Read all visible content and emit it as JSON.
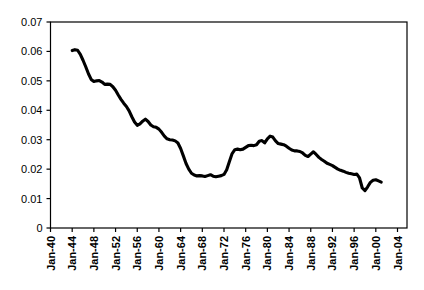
{
  "chart_data": {
    "type": "line",
    "title": "",
    "subtitle": "",
    "xlabel": "",
    "ylabel": "",
    "grid": false,
    "legend": null,
    "legend_position": "none",
    "xlim": [
      "Jan-40",
      "Jan-05"
    ],
    "ylim": [
      0,
      0.07
    ],
    "y_ticks": [
      0,
      0.01,
      0.02,
      0.03,
      0.04,
      0.05,
      0.06,
      0.07
    ],
    "y_tick_labels": [
      "0",
      "0.01",
      "0.02",
      "0.03",
      "0.04",
      "0.05",
      "0.06",
      "0.07"
    ],
    "x_ticks": [
      "Jan-40",
      "Jan-44",
      "Jan-48",
      "Jan-52",
      "Jan-56",
      "Jan-60",
      "Jan-64",
      "Jan-68",
      "Jan-72",
      "Jan-76",
      "Jan-80",
      "Jan-84",
      "Jan-88",
      "Jan-92",
      "Jan-96",
      "Jan-00",
      "Jan-04"
    ],
    "x_tick_labels": [
      "Jan-40",
      "Jan-44",
      "Jan-48",
      "Jan-52",
      "Jan-56",
      "Jan-60",
      "Jan-64",
      "Jan-68",
      "Jan-72",
      "Jan-76",
      "Jan-80",
      "Jan-84",
      "Jan-88",
      "Jan-92",
      "Jan-96",
      "Jan-00",
      "Jan-04"
    ],
    "series": [
      {
        "name": "series-1",
        "color": "#000000",
        "x": [
          1944.0,
          1944.5,
          1945.0,
          1945.5,
          1946.0,
          1946.5,
          1947.0,
          1947.5,
          1948.0,
          1948.5,
          1949.0,
          1949.5,
          1950.0,
          1950.5,
          1951.0,
          1951.5,
          1952.0,
          1952.5,
          1953.0,
          1953.5,
          1954.0,
          1954.5,
          1955.0,
          1955.5,
          1956.0,
          1956.5,
          1957.0,
          1957.5,
          1958.0,
          1958.5,
          1959.0,
          1959.5,
          1960.0,
          1960.5,
          1961.0,
          1961.5,
          1962.0,
          1962.5,
          1963.0,
          1963.5,
          1964.0,
          1964.5,
          1965.0,
          1965.5,
          1966.0,
          1966.5,
          1967.0,
          1967.5,
          1968.0,
          1968.5,
          1969.0,
          1969.5,
          1970.0,
          1970.5,
          1971.0,
          1971.5,
          1972.0,
          1972.5,
          1973.0,
          1973.5,
          1974.0,
          1974.5,
          1975.0,
          1975.5,
          1976.0,
          1976.5,
          1977.0,
          1977.5,
          1978.0,
          1978.5,
          1979.0,
          1979.5,
          1980.0,
          1980.5,
          1981.0,
          1981.5,
          1982.0,
          1982.5,
          1983.0,
          1983.5,
          1984.0,
          1984.5,
          1985.0,
          1985.5,
          1986.0,
          1986.5,
          1987.0,
          1987.5,
          1988.0,
          1988.5,
          1989.0,
          1989.5,
          1990.0,
          1990.5,
          1991.0,
          1991.5,
          1992.0,
          1992.5,
          1993.0,
          1993.5,
          1994.0,
          1994.5,
          1995.0,
          1995.5,
          1996.0,
          1996.5,
          1997.0,
          1997.5,
          1998.0,
          1998.5,
          1999.0,
          1999.5,
          2000.0,
          2000.5,
          2001.0
        ],
        "y": [
          0.0603,
          0.0606,
          0.0604,
          0.059,
          0.057,
          0.0548,
          0.0524,
          0.0505,
          0.0498,
          0.05,
          0.0501,
          0.0496,
          0.0488,
          0.0489,
          0.0488,
          0.048,
          0.0468,
          0.0452,
          0.0437,
          0.0424,
          0.0413,
          0.0398,
          0.0378,
          0.036,
          0.0349,
          0.0354,
          0.0363,
          0.037,
          0.0362,
          0.035,
          0.0344,
          0.0342,
          0.0336,
          0.0325,
          0.0312,
          0.0303,
          0.03,
          0.0299,
          0.0296,
          0.0289,
          0.027,
          0.0245,
          0.0219,
          0.02,
          0.0186,
          0.018,
          0.0177,
          0.0178,
          0.0177,
          0.0175,
          0.0178,
          0.0181,
          0.0176,
          0.0174,
          0.0176,
          0.0178,
          0.0182,
          0.0198,
          0.0226,
          0.0253,
          0.0266,
          0.0268,
          0.0266,
          0.0268,
          0.0274,
          0.028,
          0.0281,
          0.028,
          0.0283,
          0.0295,
          0.0297,
          0.0289,
          0.0303,
          0.0312,
          0.0309,
          0.0296,
          0.0287,
          0.0285,
          0.0283,
          0.0278,
          0.0271,
          0.0265,
          0.0262,
          0.0262,
          0.026,
          0.0255,
          0.0247,
          0.0243,
          0.0251,
          0.0259,
          0.025,
          0.024,
          0.0233,
          0.0227,
          0.022,
          0.0216,
          0.0212,
          0.0206,
          0.02,
          0.0196,
          0.0193,
          0.0189,
          0.0186,
          0.0184,
          0.0182,
          0.0183,
          0.017,
          0.0136,
          0.0127,
          0.014,
          0.0155,
          0.0162,
          0.0164,
          0.016,
          0.0156
        ]
      }
    ],
    "annotations": []
  }
}
